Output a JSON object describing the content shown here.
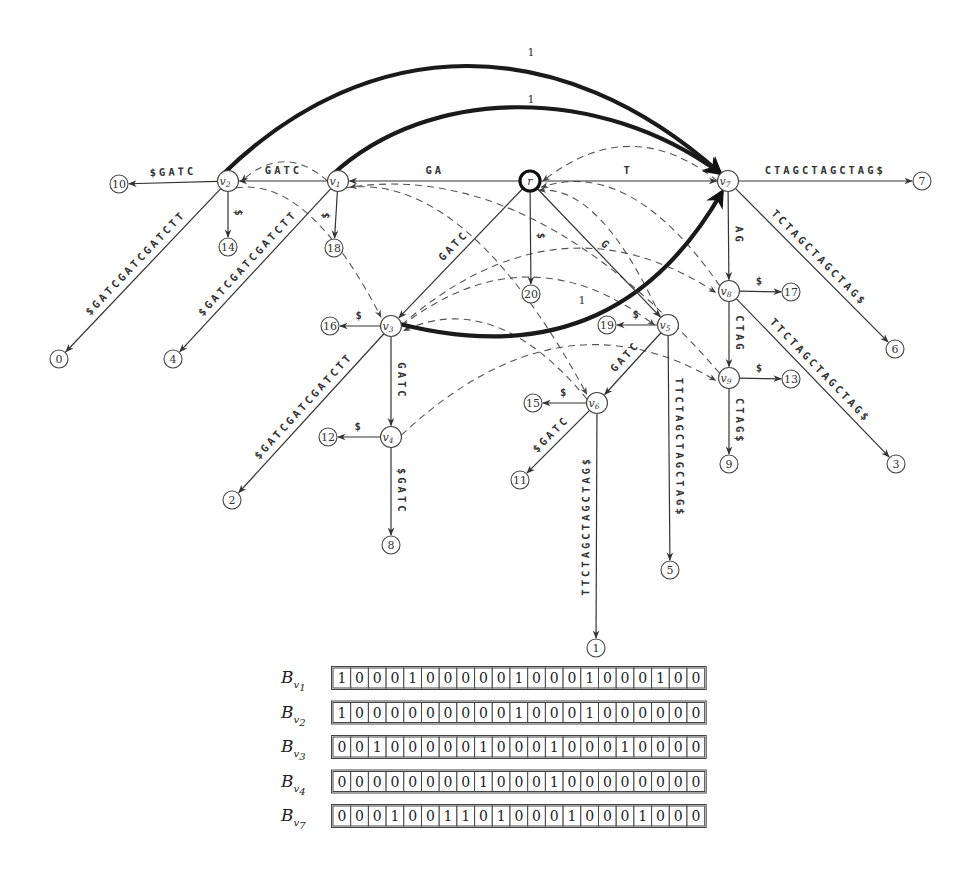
{
  "diagram": {
    "type": "suffix-tree-with-links",
    "nodes": [
      {
        "id": "r",
        "label": "r",
        "x": 530,
        "y": 181,
        "root": true
      },
      {
        "id": "v1",
        "label": "v",
        "sub": "1",
        "x": 338,
        "y": 181
      },
      {
        "id": "v2",
        "label": "v",
        "sub": "2",
        "x": 228,
        "y": 181
      },
      {
        "id": "v3",
        "label": "v",
        "sub": "3",
        "x": 391,
        "y": 326
      },
      {
        "id": "v4",
        "label": "v",
        "sub": "4",
        "x": 391,
        "y": 437
      },
      {
        "id": "v5",
        "label": "v",
        "sub": "5",
        "x": 668,
        "y": 325
      },
      {
        "id": "v6",
        "label": "v",
        "sub": "6",
        "x": 597,
        "y": 403
      },
      {
        "id": "v7",
        "label": "v",
        "sub": "7",
        "x": 728,
        "y": 181
      },
      {
        "id": "v8",
        "label": "v",
        "sub": "8",
        "x": 729,
        "y": 291
      },
      {
        "id": "v9",
        "label": "v",
        "sub": "9",
        "x": 729,
        "y": 378
      }
    ],
    "leaves": [
      {
        "id": "L0",
        "label": "0",
        "x": 59,
        "y": 359
      },
      {
        "id": "L1",
        "label": "1",
        "x": 596,
        "y": 648
      },
      {
        "id": "L2",
        "label": "2",
        "x": 232,
        "y": 500
      },
      {
        "id": "L3",
        "label": "3",
        "x": 896,
        "y": 464
      },
      {
        "id": "L4",
        "label": "4",
        "x": 173,
        "y": 359
      },
      {
        "id": "L5",
        "label": "5",
        "x": 670,
        "y": 570
      },
      {
        "id": "L6",
        "label": "6",
        "x": 895,
        "y": 349
      },
      {
        "id": "L7",
        "label": "7",
        "x": 922,
        "y": 181
      },
      {
        "id": "L8",
        "label": "8",
        "x": 391,
        "y": 545
      },
      {
        "id": "L9",
        "label": "9",
        "x": 729,
        "y": 464
      },
      {
        "id": "L10",
        "label": "10",
        "x": 119,
        "y": 184
      },
      {
        "id": "L11",
        "label": "11",
        "x": 520,
        "y": 480
      },
      {
        "id": "L12",
        "label": "12",
        "x": 328,
        "y": 437
      },
      {
        "id": "L13",
        "label": "13",
        "x": 791,
        "y": 379
      },
      {
        "id": "L14",
        "label": "14",
        "x": 228,
        "y": 247
      },
      {
        "id": "L15",
        "label": "15",
        "x": 533,
        "y": 403
      },
      {
        "id": "L16",
        "label": "16",
        "x": 330,
        "y": 326
      },
      {
        "id": "L17",
        "label": "17",
        "x": 791,
        "y": 292
      },
      {
        "id": "L18",
        "label": "18",
        "x": 334,
        "y": 248
      },
      {
        "id": "L19",
        "label": "19",
        "x": 607,
        "y": 325
      },
      {
        "id": "L20",
        "label": "20",
        "x": 531,
        "y": 294
      }
    ],
    "edges": [
      {
        "from": "r",
        "to": "v1",
        "label": "GA"
      },
      {
        "from": "r",
        "to": "v7",
        "label": "T"
      },
      {
        "from": "r",
        "to": "v3",
        "label": "GATC"
      },
      {
        "from": "r",
        "to": "v5",
        "label": "G"
      },
      {
        "from": "r",
        "to": "L20",
        "label": "$"
      },
      {
        "from": "v1",
        "to": "v2",
        "label": "GATC"
      },
      {
        "from": "v1",
        "to": "L18",
        "label": "$"
      },
      {
        "from": "v1",
        "to": "L4",
        "label": "$GATCGATCGATCTT"
      },
      {
        "from": "v2",
        "to": "L10",
        "label": "$GATC"
      },
      {
        "from": "v2",
        "to": "L14",
        "label": "$"
      },
      {
        "from": "v2",
        "to": "L0",
        "label": "$GATCGATCGATCTT"
      },
      {
        "from": "v3",
        "to": "L16",
        "label": "$"
      },
      {
        "from": "v3",
        "to": "v4",
        "label": "GATC"
      },
      {
        "from": "v3",
        "to": "L2",
        "label": "$GATCGATCGATCTT"
      },
      {
        "from": "v4",
        "to": "L12",
        "label": "$"
      },
      {
        "from": "v4",
        "to": "L8",
        "label": "$GATC"
      },
      {
        "from": "v5",
        "to": "L19",
        "label": "$"
      },
      {
        "from": "v5",
        "to": "v6",
        "label": "GATC"
      },
      {
        "from": "v5",
        "to": "L5",
        "label": "TTCTAGCTAGCTAG$"
      },
      {
        "from": "v6",
        "to": "L15",
        "label": "$"
      },
      {
        "from": "v6",
        "to": "L11",
        "label": "$GATC"
      },
      {
        "from": "v6",
        "to": "L1",
        "label": "TTCTAGCTAGCTAG$"
      },
      {
        "from": "v7",
        "to": "L7",
        "label": "CTAGCTAGCTAG$"
      },
      {
        "from": "v7",
        "to": "v8",
        "label": "AG"
      },
      {
        "from": "v7",
        "to": "L6",
        "label": "TCTAGCTAGCTAG$"
      },
      {
        "from": "v8",
        "to": "L17",
        "label": "$"
      },
      {
        "from": "v8",
        "to": "v9",
        "label": "CTAG"
      },
      {
        "from": "v8",
        "to": "L3",
        "label": "TTCTAGCTAGCTAG$"
      },
      {
        "from": "v9",
        "to": "L13",
        "label": "$"
      },
      {
        "from": "v9",
        "to": "L9",
        "label": "CTAG$"
      }
    ],
    "weighted_links": [
      {
        "from": "v2",
        "to": "v7",
        "label": "1"
      },
      {
        "from": "v1",
        "to": "v7",
        "label": "1"
      },
      {
        "from": "v3",
        "to": "v7",
        "label": "1"
      }
    ],
    "suffix_links_dashed": [
      {
        "from": "v1",
        "to": "v2"
      },
      {
        "from": "v2",
        "to": "v3"
      },
      {
        "from": "v7",
        "to": "r"
      },
      {
        "from": "v5",
        "to": "r"
      },
      {
        "from": "v8",
        "to": "r"
      },
      {
        "from": "v3",
        "to": "v8"
      },
      {
        "from": "v1",
        "to": "v6"
      },
      {
        "from": "v6",
        "to": "v3"
      },
      {
        "from": "v4",
        "to": "v9"
      },
      {
        "from": "v9",
        "to": "v1"
      },
      {
        "from": "v3",
        "to": "v5"
      }
    ]
  },
  "bit_vectors": {
    "rows": [
      {
        "name": "B",
        "sub": "v",
        "subsub": "1",
        "bits": [
          1,
          0,
          0,
          0,
          1,
          0,
          0,
          0,
          0,
          0,
          1,
          0,
          0,
          0,
          1,
          0,
          0,
          0,
          1,
          0,
          0
        ]
      },
      {
        "name": "B",
        "sub": "v",
        "subsub": "2",
        "bits": [
          1,
          0,
          0,
          0,
          0,
          0,
          0,
          0,
          0,
          0,
          1,
          0,
          0,
          0,
          1,
          0,
          0,
          0,
          0,
          0,
          0
        ]
      },
      {
        "name": "B",
        "sub": "v",
        "subsub": "3",
        "bits": [
          0,
          0,
          1,
          0,
          0,
          0,
          0,
          0,
          1,
          0,
          0,
          0,
          1,
          0,
          0,
          0,
          1,
          0,
          0,
          0,
          0
        ]
      },
      {
        "name": "B",
        "sub": "v",
        "subsub": "4",
        "bits": [
          0,
          0,
          0,
          0,
          0,
          0,
          0,
          0,
          1,
          0,
          0,
          0,
          1,
          0,
          0,
          0,
          0,
          0,
          0,
          0,
          0
        ]
      },
      {
        "name": "B",
        "sub": "v",
        "subsub": "7",
        "bits": [
          0,
          0,
          0,
          1,
          0,
          0,
          1,
          1,
          0,
          1,
          0,
          0,
          0,
          1,
          0,
          0,
          0,
          1,
          0,
          0,
          0
        ]
      }
    ]
  }
}
